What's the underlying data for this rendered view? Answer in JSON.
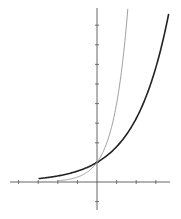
{
  "chart_data": {
    "type": "line",
    "title": "",
    "xlabel": "",
    "ylabel": "",
    "xlim": [
      -4.6,
      3.85
    ],
    "ylim": [
      -1.95,
      9.3
    ],
    "x_ticks": [
      -4,
      -3,
      -2,
      -1,
      1,
      2,
      3
    ],
    "y_ticks": [
      -1,
      1,
      2,
      3,
      4,
      5,
      6,
      7,
      8
    ],
    "tick_labels_visible": false,
    "grid": false,
    "legend": null,
    "series": [
      {
        "name": "y = 1.8^x",
        "base": 1.8,
        "color": "#222222",
        "stroke_width": 1.6,
        "x_range": [
          -2.95,
          3.65
        ],
        "points": [
          [
            -2.95,
            0.18
          ],
          [
            -2,
            0.31
          ],
          [
            -1,
            0.56
          ],
          [
            0,
            1
          ],
          [
            1,
            1.8
          ],
          [
            2,
            3.24
          ],
          [
            3,
            5.83
          ],
          [
            3.65,
            8.55
          ]
        ]
      },
      {
        "name": "y = 4^x",
        "base": 4,
        "color": "#a0a0a0",
        "stroke_width": 1.0,
        "x_range": [
          -2.0,
          1.57
        ],
        "points": [
          [
            -2,
            0.06
          ],
          [
            -1,
            0.25
          ],
          [
            0,
            1
          ],
          [
            0.5,
            2
          ],
          [
            1,
            4
          ],
          [
            1.5,
            8
          ],
          [
            1.57,
            8.84
          ]
        ]
      }
    ],
    "annotations": []
  },
  "layout": {
    "origin_px": [
      97,
      182
    ],
    "unit_px": 19.6,
    "axis_color": "#555555",
    "x_axis_px": [
      10,
      170
    ],
    "y_axis_px": [
      8,
      210
    ]
  }
}
